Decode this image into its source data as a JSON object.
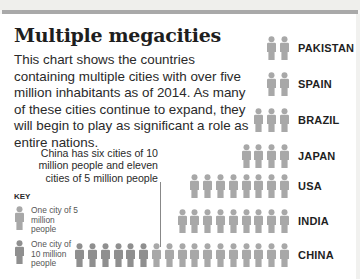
{
  "title": "Multiple megacities",
  "intro": "This chart shows the countries containing multiple cities with over five million inhabitants as of 2014. As many of these cities continue to expand, they will begin to play as significant a role as entire nations.",
  "annotation": "China has six cities of 10 million people and eleven cities of 5 million people",
  "key": {
    "title": "KEY",
    "items": [
      {
        "label": "One city of 5 million people",
        "type": "5m"
      },
      {
        "label": "One city of 10 million people",
        "type": "10m"
      }
    ]
  },
  "colors": {
    "five_million": "#a8a8a8",
    "ten_million": "#8f8f8f",
    "bar": "#a9a9a9"
  },
  "chart_data": {
    "type": "pictogram",
    "title": "Multiple megacities",
    "categories": [
      "PAKISTAN",
      "SPAIN",
      "BRAZIL",
      "JAPAN",
      "USA",
      "INDIA",
      "CHINA"
    ],
    "series": [
      {
        "name": "Cities of 5 million people",
        "values": [
          2,
          2,
          3,
          4,
          8,
          9,
          11
        ]
      },
      {
        "name": "Cities of 10 million people",
        "values": [
          0,
          0,
          0,
          0,
          0,
          0,
          6
        ]
      }
    ],
    "total_icons": [
      2,
      2,
      3,
      4,
      8,
      9,
      17
    ],
    "annotations": [
      "China has six cities of 10 million people and eleven cities of 5 million people"
    ],
    "legend": [
      "One city of 5 million people",
      "One city of 10 million people"
    ]
  },
  "rows": [
    {
      "label": "PAKISTAN",
      "five": 2,
      "ten": 0,
      "top": 36
    },
    {
      "label": "SPAIN",
      "five": 2,
      "ten": 0,
      "top": 72
    },
    {
      "label": "BRAZIL",
      "five": 3,
      "ten": 0,
      "top": 108
    },
    {
      "label": "JAPAN",
      "five": 4,
      "ten": 0,
      "top": 144
    },
    {
      "label": "USA",
      "five": 8,
      "ten": 0,
      "top": 174
    },
    {
      "label": "INDIA",
      "five": 9,
      "ten": 0,
      "top": 209
    },
    {
      "label": "CHINA",
      "five": 11,
      "ten": 6,
      "top": 243
    }
  ]
}
